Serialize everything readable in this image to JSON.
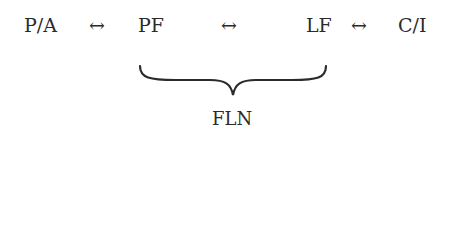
{
  "diagram": {
    "nodes": [
      {
        "id": "pa",
        "label": "P/A"
      },
      {
        "id": "pf",
        "label": "PF"
      },
      {
        "id": "lf",
        "label": "LF"
      },
      {
        "id": "ci",
        "label": "C/I"
      }
    ],
    "arrows": [
      "↔",
      "↔",
      "↔"
    ],
    "brace_label": "FLN",
    "colors": {
      "text": "#2b2b2b",
      "background": "#ffffff"
    }
  }
}
